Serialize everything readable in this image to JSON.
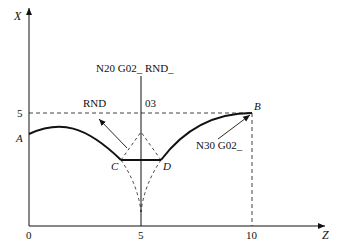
{
  "axes": {
    "vertical_label": "X",
    "horizontal_label": "Z",
    "origin_label": "0",
    "x_ticks": [
      "5",
      "10"
    ],
    "y_ticks": [
      "5"
    ]
  },
  "points": {
    "A": "A",
    "B": "B",
    "C": "C",
    "D": "D"
  },
  "annotations": {
    "n20": "N20  G02_  RND_",
    "rnd": "RND",
    "o3": "03",
    "n30": "N30  G02_"
  },
  "colors": {
    "line": "#111111",
    "background": "#ffffff"
  }
}
